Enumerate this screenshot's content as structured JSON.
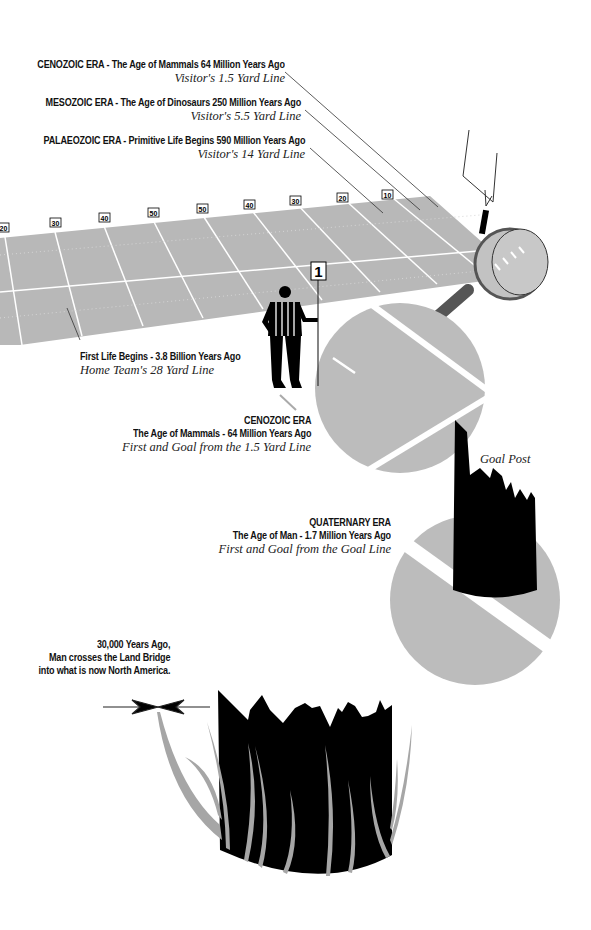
{
  "annotations": {
    "cenozoic_top": {
      "head": "CENOZOIC ERA - The Age of Mammals 64 Million Years Ago",
      "sub": "Visitor's 1.5 Yard Line"
    },
    "mesozoic": {
      "head": "MESOZOIC ERA - The Age of Dinosaurs 250 Million Years Ago",
      "sub": "Visitor's 5.5 Yard Line"
    },
    "palaeozoic": {
      "head": "PALAEOZOIC ERA - Primitive Life Begins 590 Million Years Ago",
      "sub": "Visitor's 14 Yard Line"
    },
    "first_life": {
      "head": "First Life Begins - 3.8 Billion Years Ago",
      "sub": "Home Team's 28 Yard Line"
    },
    "cenozoic_zoom": {
      "title": "CENOZOIC ERA",
      "head": "The Age of Mammals - 64 Million Years Ago",
      "sub": "First and Goal from the 1.5 Yard Line"
    },
    "quaternary": {
      "title": "QUATERNARY ERA",
      "head": "The Age of Man - 1.7 Million Years Ago",
      "sub": "First and Goal from the Goal Line"
    },
    "land_bridge": {
      "line1": "30,000 Years Ago,",
      "line2": "Man crosses the Land Bridge",
      "line3": "into what is now North America."
    },
    "goal_post": "Goal Post"
  },
  "field": {
    "yard_markers": [
      "20",
      "30",
      "40",
      "50",
      "50",
      "40",
      "30",
      "20",
      "10"
    ],
    "down_marker": "1"
  },
  "colors": {
    "field": "#b8b8b8",
    "field_lines": "#ffffff",
    "circle": "#bcbcbc",
    "ink": "#000000",
    "grass": "#a6a6a6",
    "handle": "#555555"
  }
}
